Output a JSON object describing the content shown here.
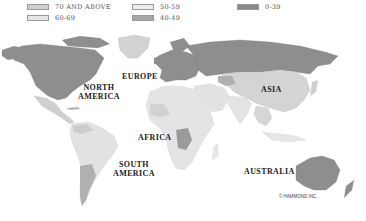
{
  "legend": {
    "items": [
      {
        "label": "70 AND ABOVE",
        "color": "#d0d0d0"
      },
      {
        "label": "60-69",
        "color": "#e3e3e3"
      },
      {
        "label": "50-59",
        "color": "#ebebeb"
      },
      {
        "label": "40-49",
        "color": "#a8a8a8"
      },
      {
        "label": "0-39",
        "color": "#8a8a8a"
      }
    ]
  },
  "map": {
    "labels": {
      "north_america": "NORTH\nAMERICA",
      "europe": "EUROPE",
      "asia": "ASIA",
      "africa": "AFRICA",
      "south_america": "SOUTH\nAMERICA",
      "australia": "AUSTRALIA"
    },
    "credit": "© HAMMOND INC.",
    "colors": {
      "dark": "#8e8e8e",
      "mid": "#b4b4b4",
      "light": "#d6d6d6",
      "lighter": "#e4e4e4",
      "ocean": "#ffffff"
    }
  }
}
